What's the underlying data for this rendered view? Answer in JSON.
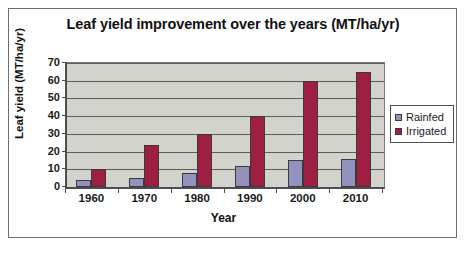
{
  "chart_data": {
    "type": "bar",
    "title": "Leaf yield improvement over the years (MT/ha/yr)",
    "xlabel": "Year",
    "ylabel": "Leaf yield (MT/ha/yr)",
    "categories": [
      "1960",
      "1970",
      "1980",
      "1990",
      "2000",
      "2010"
    ],
    "series": [
      {
        "name": "Rainfed",
        "color": "#9292bd",
        "values": [
          4,
          5,
          8,
          12,
          15,
          16
        ]
      },
      {
        "name": "Irrigated",
        "color": "#9e1f42",
        "values": [
          10,
          24,
          30,
          40,
          60,
          65
        ]
      }
    ],
    "ylim": [
      0,
      70
    ],
    "yticks": [
      0,
      10,
      20,
      30,
      40,
      50,
      60,
      70
    ],
    "ytick_labels": [
      "0",
      "10",
      "20",
      "30",
      "40",
      "50",
      "60",
      "70"
    ],
    "grid": true,
    "legend_position": "right",
    "plot_background": "#d3d3cd",
    "figure_background": "#ffffff"
  },
  "legend": {
    "entries": [
      {
        "label": "Rainfed"
      },
      {
        "label": "Irrigated"
      }
    ]
  }
}
